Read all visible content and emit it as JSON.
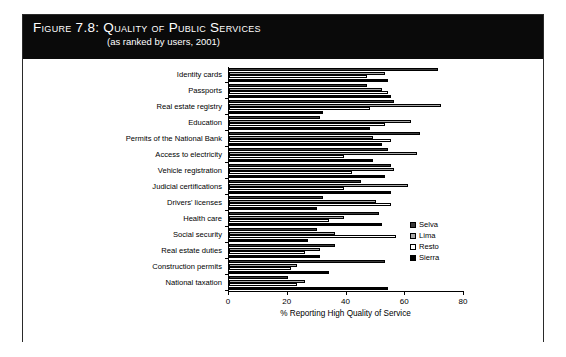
{
  "figure": {
    "title_prefix": "Figure",
    "title_number": "7.8:",
    "title_main": "Quality of Public Services",
    "title_full": "Figure 7.8:  Quality of Public Services",
    "subtitle": "(as ranked by users, 2001)"
  },
  "chart_data": {
    "type": "bar",
    "orientation": "horizontal",
    "title": "Quality of Public Services",
    "subtitle": "(as ranked by users, 2001)",
    "xlabel": "% Reporting High Quality of Service",
    "ylabel": "",
    "xlim": [
      0,
      80
    ],
    "xticks": [
      0,
      20,
      40,
      60,
      80
    ],
    "xticklabels": [
      "0",
      "20",
      "40",
      "60",
      "80"
    ],
    "grid": false,
    "legend_position": "right-inside",
    "categories": [
      "Identity cards",
      "Passports",
      "Real estate registry",
      "Education",
      "Permits of the National Bank",
      "Access to electricity",
      "Vehicle registration",
      "Judicial certifications",
      "Drivers' licenses",
      "Health care",
      "Social security",
      "Real estate duties",
      "Construction permits",
      "National taxation"
    ],
    "series": [
      {
        "name": "Selva",
        "color": "#3a3a3a",
        "values": [
          71,
          47,
          56,
          31,
          65,
          54,
          55,
          45,
          32,
          51,
          30,
          36,
          53,
          20
        ]
      },
      {
        "name": "Lima",
        "color": "#a8a8a8",
        "values": [
          53,
          52,
          72,
          62,
          49,
          64,
          56,
          61,
          50,
          39,
          36,
          31,
          23,
          26
        ]
      },
      {
        "name": "Resto",
        "color": "#ffffff",
        "values": [
          47,
          54,
          48,
          53,
          55,
          39,
          42,
          39,
          55,
          34,
          57,
          26,
          21,
          23
        ]
      },
      {
        "name": "Sierra",
        "color": "#000000",
        "values": [
          54,
          55,
          32,
          48,
          52,
          49,
          53,
          55,
          30,
          52,
          27,
          31,
          34,
          54
        ]
      }
    ],
    "legend_entries": [
      {
        "label": "Selva",
        "color": "#3a3a3a"
      },
      {
        "label": "Lima",
        "color": "#a8a8a8"
      },
      {
        "label": "Resto",
        "color": "#ffffff"
      },
      {
        "label": "Sierra",
        "color": "#000000"
      }
    ]
  }
}
